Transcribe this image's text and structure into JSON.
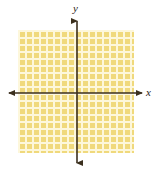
{
  "figure": {
    "name": "coordinate-plane-shaded-region",
    "background_color": "#ffffff"
  },
  "axes": {
    "x_label": "x",
    "y_label": "y",
    "line_color": "#3b2f1e",
    "origin": {
      "x": 77,
      "y": 93
    },
    "x_axis": {
      "start_x": 8,
      "end_x": 143,
      "y": 93,
      "arrows": "both"
    },
    "y_axis": {
      "start_y": 20,
      "end_y": 164,
      "x": 77,
      "arrows": "both"
    }
  },
  "shaded_region": {
    "name": "shaded-rectangle",
    "fill_color": "#f0d97c",
    "grid_line_color": "#fdf7db",
    "left": 18,
    "top": 30,
    "width": 116,
    "height": 123,
    "cell_size": 7,
    "columns": 17,
    "rows": 18
  },
  "chart_data": {
    "type": "area",
    "title": "",
    "xlabel": "x",
    "ylabel": "y",
    "grid": true,
    "legend": "none",
    "xlim": [
      -8.5,
      8.5
    ],
    "ylim": [
      -8.5,
      9.0
    ],
    "annotations": [
      "Shaded rectangular region covering the plane from approximately x = -8.5 to x = 8.5 and y = -8.5 to y = 9.0",
      "Region is filled solid; all four quadrants are shaded"
    ],
    "series": [
      {
        "name": "shaded-region",
        "kind": "rectangle",
        "x_range": [
          -8.5,
          8.5
        ],
        "y_range": [
          -8.5,
          9.0
        ],
        "fill": "#f0d97c"
      }
    ]
  }
}
